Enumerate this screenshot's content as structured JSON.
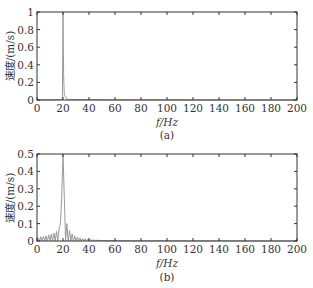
{
  "chart_data": [
    {
      "panel": "(a)",
      "type": "line",
      "title": "",
      "xlabel": "f/Hz",
      "ylabel": "速度/(m/s)",
      "xlim": [
        0,
        200
      ],
      "ylim": [
        0,
        1
      ],
      "xticks": [
        0,
        20,
        40,
        60,
        80,
        100,
        120,
        140,
        160,
        180,
        200
      ],
      "yticks": [
        0,
        0.2,
        0.4,
        0.6,
        0.8,
        1
      ],
      "ytick_labels": [
        "0",
        "0.2",
        "0.4",
        "0.6",
        "0.8",
        "1"
      ],
      "grid": false,
      "line_color": "#9a9a9a",
      "x": [
        0,
        10,
        18,
        19.5,
        20,
        20.5,
        21,
        22,
        22.5,
        23,
        25,
        30,
        40,
        60,
        100,
        200
      ],
      "y": [
        0,
        0.002,
        0.005,
        0.01,
        1.0,
        0.3,
        0.05,
        0.04,
        0.02,
        0.01,
        0.005,
        0.004,
        0.003,
        0.002,
        0.001,
        0.0
      ]
    },
    {
      "panel": "(b)",
      "type": "line",
      "title": "",
      "xlabel": "f/Hz",
      "ylabel": "速度/(m/s)",
      "xlim": [
        0,
        200
      ],
      "ylim": [
        0,
        0.5
      ],
      "xticks": [
        0,
        20,
        40,
        60,
        80,
        100,
        120,
        140,
        160,
        180,
        200
      ],
      "yticks": [
        0,
        0.1,
        0.2,
        0.3,
        0.4,
        0.5
      ],
      "ytick_labels": [
        "0",
        "0.1",
        "0.2",
        "0.3",
        "0.4",
        "0.5"
      ],
      "grid": false,
      "line_color": "#9a9a9a",
      "x": [
        0,
        1,
        2,
        3,
        4,
        5,
        6,
        7,
        8,
        9,
        10,
        11,
        12,
        13,
        14,
        15,
        16,
        17,
        18,
        19,
        20,
        21,
        22,
        23,
        24,
        25,
        26,
        27,
        28,
        29,
        30,
        31,
        32,
        33,
        34,
        35,
        36,
        37,
        38,
        39,
        40,
        45,
        50,
        60,
        80,
        100,
        200
      ],
      "y": [
        0.0,
        0.02,
        0.0,
        0.025,
        0.0,
        0.028,
        0.0,
        0.03,
        0.0,
        0.035,
        0.0,
        0.04,
        0.0,
        0.045,
        0.0,
        0.055,
        0.0,
        0.07,
        0.1,
        0.25,
        0.5,
        0.25,
        0.0,
        0.1,
        0.0,
        0.06,
        0.0,
        0.04,
        0.0,
        0.03,
        0.0,
        0.022,
        0.0,
        0.018,
        0.0,
        0.014,
        0.0,
        0.012,
        0.0,
        0.01,
        0.006,
        0.004,
        0.003,
        0.002,
        0.001,
        0.001,
        0.0
      ]
    }
  ],
  "panels": {
    "a": {
      "caption": "(a)",
      "xlabel": "f/Hz",
      "ylabel": "速度/(m/s)",
      "xtick_labels": [
        "0",
        "20",
        "40",
        "60",
        "80",
        "100",
        "120",
        "140",
        "160",
        "180",
        "200"
      ],
      "ytick_labels": [
        "0",
        "0.2",
        "0.4",
        "0.6",
        "0.8",
        "1"
      ]
    },
    "b": {
      "caption": "(b)",
      "xlabel": "f/Hz",
      "ylabel": "速度/(m/s)",
      "xtick_labels": [
        "0",
        "20",
        "40",
        "60",
        "80",
        "100",
        "120",
        "140",
        "160",
        "180",
        "200"
      ],
      "ytick_labels": [
        "0",
        "0.1",
        "0.2",
        "0.3",
        "0.4",
        "0.5"
      ]
    }
  }
}
